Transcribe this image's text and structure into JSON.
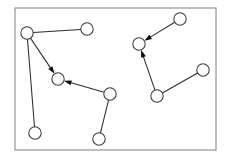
{
  "figure": {
    "width": 228,
    "height": 158,
    "background_color": "#ffffff"
  },
  "frame": {
    "name": "plot-border",
    "x": 15,
    "y": 8,
    "width": 201,
    "height": 142,
    "stroke_color": "#8a8a8a",
    "stroke_width": 1.1
  },
  "style": {
    "node_radius": 6.2,
    "node_fill": "#ffffff",
    "node_stroke": "#3a3a3a",
    "node_stroke_width": 1.05,
    "edge_stroke": "#2b2b2b",
    "edge_stroke_width": 1.05,
    "arrow_fill": "#101010",
    "arrow_length": 7.5,
    "arrow_width": 5.0
  },
  "graph": {
    "node_count": 10,
    "edge_count": 9,
    "directed_edge_count": 4,
    "undirected_edge_count": 5,
    "component_count": 2,
    "nodes": [
      {
        "id": "n1",
        "label": "",
        "cx": 27,
        "cy": 33,
        "cluster": "left"
      },
      {
        "id": "n2",
        "label": "",
        "cx": 87,
        "cy": 29,
        "cluster": "left"
      },
      {
        "id": "n3",
        "label": "",
        "cx": 58,
        "cy": 79,
        "cluster": "left"
      },
      {
        "id": "n4",
        "label": "",
        "cx": 110,
        "cy": 94,
        "cluster": "left"
      },
      {
        "id": "n5",
        "label": "",
        "cx": 35,
        "cy": 133,
        "cluster": "left"
      },
      {
        "id": "n6",
        "label": "",
        "cx": 99,
        "cy": 139,
        "cluster": "left"
      },
      {
        "id": "n7",
        "label": "",
        "cx": 180,
        "cy": 19,
        "cluster": "right"
      },
      {
        "id": "n8",
        "label": "",
        "cx": 139,
        "cy": 44,
        "cluster": "right"
      },
      {
        "id": "n9",
        "label": "",
        "cx": 157,
        "cy": 96,
        "cluster": "right"
      },
      {
        "id": "n10",
        "label": "",
        "cx": 203,
        "cy": 70,
        "cluster": "right"
      }
    ],
    "edges": [
      {
        "id": "e1",
        "source": "n1",
        "target": "n2",
        "directed": false
      },
      {
        "id": "e2",
        "source": "n1",
        "target": "n3",
        "directed": true
      },
      {
        "id": "e3",
        "source": "n1",
        "target": "n5",
        "directed": false
      },
      {
        "id": "e4",
        "source": "n4",
        "target": "n3",
        "directed": true
      },
      {
        "id": "e5",
        "source": "n4",
        "target": "n6",
        "directed": false
      },
      {
        "id": "e6",
        "source": "n7",
        "target": "n8",
        "directed": true
      },
      {
        "id": "e7",
        "source": "n9",
        "target": "n8",
        "directed": true
      },
      {
        "id": "e8",
        "source": "n9",
        "target": "n10",
        "directed": false
      }
    ]
  }
}
